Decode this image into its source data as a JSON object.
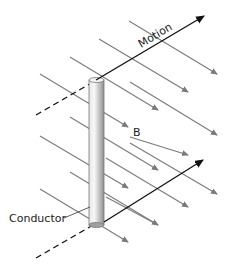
{
  "labels": {
    "motion": "Motion",
    "field": "B",
    "conductor": "Conductor"
  },
  "colors": {
    "field_lines": "#7a7a7a",
    "motion_arrows": "#111111",
    "conductor_light": "#f2f2f2",
    "conductor_dark": "#9a9a9a"
  }
}
